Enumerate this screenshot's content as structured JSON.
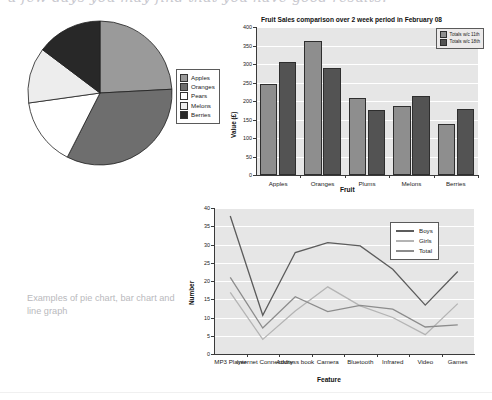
{
  "top_partial_text": "a few days you may find that you have good results.",
  "caption": "Examples of pie chart, bar chart and line graph",
  "pie": {
    "legend_title": "",
    "items": [
      {
        "label": "Apples",
        "value": 87,
        "color": "#9a9a9a"
      },
      {
        "label": "Oranges",
        "value": 120,
        "color": "#6e6e6e"
      },
      {
        "label": "Pears",
        "value": 55,
        "color": "#ffffff"
      },
      {
        "label": "Melons",
        "value": 45,
        "color": "#ededed"
      },
      {
        "label": "Berries",
        "value": 53,
        "color": "#282828"
      }
    ]
  },
  "bar": {
    "title": "Fruit Sales comparison over 2 week period in February 08",
    "ylabel": "Value (£)",
    "xlabel": "Fruit",
    "ymin": 0,
    "ymax": 400,
    "ystep": 50,
    "yticks": [
      "0",
      "50",
      "100",
      "150",
      "200",
      "250",
      "300",
      "350",
      "400"
    ],
    "categories": [
      "Apples",
      "Oranges",
      "Plums",
      "Melons",
      "Berries"
    ],
    "series": [
      {
        "name": "Totals w/c 11th",
        "color": "#8e8e8e",
        "values": [
          245,
          362,
          208,
          187,
          138
        ]
      },
      {
        "name": "Totals w/c 18th",
        "color": "#535353",
        "values": [
          305,
          290,
          175,
          214,
          178
        ]
      }
    ]
  },
  "line": {
    "title": "",
    "ylabel": "Number",
    "xlabel": "Feature",
    "ymin": 0,
    "ymax": 40,
    "ystep": 5,
    "yticks": [
      "0",
      "5",
      "10",
      "15",
      "20",
      "25",
      "30",
      "35",
      "40"
    ],
    "categories": [
      "MP3 Player",
      "Internet Connectivity",
      "Address book",
      "Camera",
      "Bluetooth",
      "Infrared",
      "Video",
      "Games"
    ],
    "series": [
      {
        "name": "Boys",
        "color": "#5c5c5c",
        "values": [
          37.8,
          10.6,
          27.8,
          30.5,
          29.6,
          23.2,
          13.4,
          22.6
        ]
      },
      {
        "name": "Girls",
        "color": "#b4b4b4",
        "values": [
          16.9,
          4.0,
          11.8,
          18.4,
          13.2,
          10.0,
          5.3,
          13.8
        ]
      },
      {
        "name": "Total",
        "color": "#8c8c8c",
        "values": [
          21.0,
          7.1,
          15.7,
          11.6,
          13.3,
          12.3,
          7.4,
          8.0
        ]
      }
    ]
  },
  "chart_data": [
    {
      "type": "pie",
      "title": "",
      "categories": [
        "Apples",
        "Oranges",
        "Pears",
        "Melons",
        "Berries"
      ],
      "values": [
        87,
        120,
        55,
        45,
        53
      ],
      "unit": "degrees",
      "legend_position": "right",
      "note": "Slice sizes read as angular sweeps starting at 12 o'clock going clockwise"
    },
    {
      "type": "bar",
      "title": "Fruit Sales comparison over 2 week period in February 08",
      "xlabel": "Fruit",
      "ylabel": "Value (£)",
      "ylim": [
        0,
        400
      ],
      "ytick_step": 50,
      "grid": true,
      "legend_position": "top-right",
      "categories": [
        "Apples",
        "Oranges",
        "Plums",
        "Melons",
        "Berries"
      ],
      "series": [
        {
          "name": "Totals w/c 11th",
          "values": [
            245,
            362,
            208,
            187,
            138
          ]
        },
        {
          "name": "Totals w/c 18th",
          "values": [
            305,
            290,
            175,
            214,
            178
          ]
        }
      ]
    },
    {
      "type": "line",
      "title": "",
      "xlabel": "Feature",
      "ylabel": "Number",
      "ylim": [
        0,
        40
      ],
      "ytick_step": 5,
      "grid": true,
      "legend_position": "top-right",
      "categories": [
        "MP3 Player",
        "Internet Connectivity",
        "Address book",
        "Camera",
        "Bluetooth",
        "Infrared",
        "Video",
        "Games"
      ],
      "series": [
        {
          "name": "Boys",
          "values": [
            37.8,
            10.6,
            27.8,
            30.5,
            29.6,
            23.2,
            13.4,
            22.6
          ]
        },
        {
          "name": "Girls",
          "values": [
            16.9,
            4.0,
            11.8,
            18.4,
            13.2,
            10.0,
            5.3,
            13.8
          ]
        },
        {
          "name": "Total",
          "values": [
            21.0,
            7.1,
            15.7,
            11.6,
            13.3,
            12.3,
            7.4,
            8.0
          ]
        }
      ]
    }
  ]
}
